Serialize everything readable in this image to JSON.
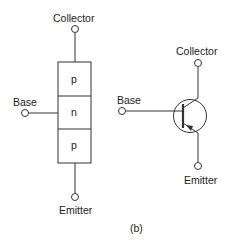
{
  "figure": {
    "caption": "(b)",
    "layer_diagram": {
      "collector_label": "Collector",
      "base_label": "Base",
      "emitter_label": "Emitter",
      "layers": [
        "p",
        "n",
        "p"
      ]
    },
    "symbol": {
      "type": "PNP transistor",
      "collector_label": "Collector",
      "base_label": "Base",
      "emitter_label": "Emitter"
    },
    "colors": {
      "stroke": "#333333",
      "background": "#ffffff"
    }
  }
}
